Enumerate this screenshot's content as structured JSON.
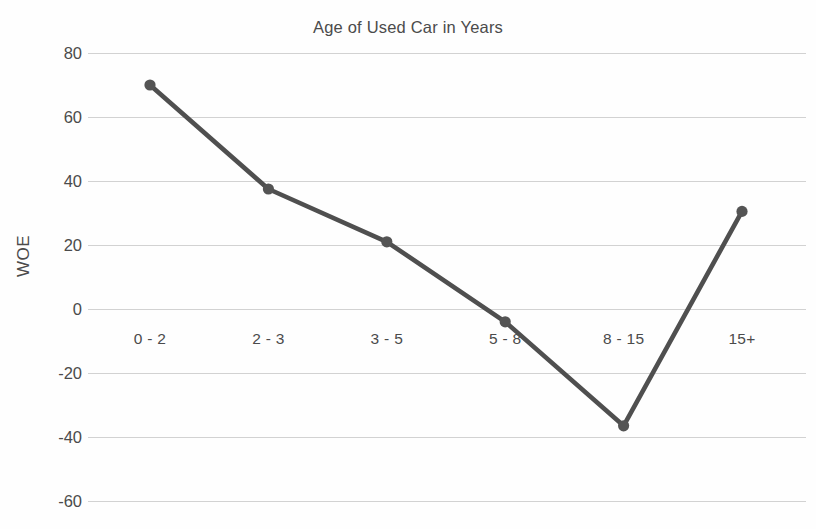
{
  "chart_data": {
    "type": "line",
    "title": "Age of Used Car in Years",
    "xlabel": "",
    "ylabel": "WOE",
    "categories": [
      "0 - 2",
      "2 - 3",
      "3 - 5",
      "5 - 8",
      "8 - 15",
      "15+"
    ],
    "values": [
      70,
      37.5,
      21,
      -4,
      -36.5,
      30.5
    ],
    "series": [
      {
        "name": "WOE",
        "values": [
          70,
          37.5,
          21,
          -4,
          -36.5,
          30.5
        ]
      }
    ],
    "ylim": [
      -60,
      80
    ],
    "yticks": [
      80,
      60,
      40,
      20,
      0,
      -20,
      -40,
      -60
    ],
    "ytick_labels": [
      "80",
      "60",
      "40",
      "20",
      "0",
      "-20",
      "-40",
      "-60"
    ],
    "grid": true,
    "legend": "none",
    "line_color": "#4f4f4f",
    "marker_color": "#545454",
    "grid_color": "#d2d2d2",
    "background_color": "#fefefe",
    "text_color": "#4b4b4b"
  }
}
